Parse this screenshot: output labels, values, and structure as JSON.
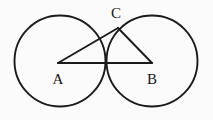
{
  "figure": {
    "kind": "geometry-diagram",
    "background_color": "#fbfbfb",
    "stroke_color": "#1b1b1b",
    "label_color": "#151515",
    "canvas": {
      "width": 213,
      "height": 120
    },
    "circles": [
      {
        "name": "circle-a",
        "cx": 60,
        "cy": 61,
        "r": 45.5
      },
      {
        "name": "circle-b",
        "cx": 152,
        "cy": 61,
        "r": 45.5
      }
    ],
    "points": [
      {
        "id": "A",
        "label": "A",
        "x": 58,
        "y": 63,
        "label_x": 58,
        "label_y": 84
      },
      {
        "id": "B",
        "label": "B",
        "x": 152,
        "y": 63,
        "label_x": 152,
        "label_y": 84
      },
      {
        "id": "C",
        "label": "C",
        "x": 118,
        "y": 28,
        "label_x": 116,
        "label_y": 18
      }
    ],
    "segments": [
      {
        "name": "segment-ab",
        "from": "A",
        "to": "B",
        "path": "M 58 63 L 152 63"
      },
      {
        "name": "segment-ac",
        "from": "A",
        "to": "C",
        "path": "M 58 63 L 118 28"
      },
      {
        "name": "segment-cb",
        "from": "C",
        "to": "B",
        "path": "M 118 28 L 152 63"
      }
    ]
  }
}
